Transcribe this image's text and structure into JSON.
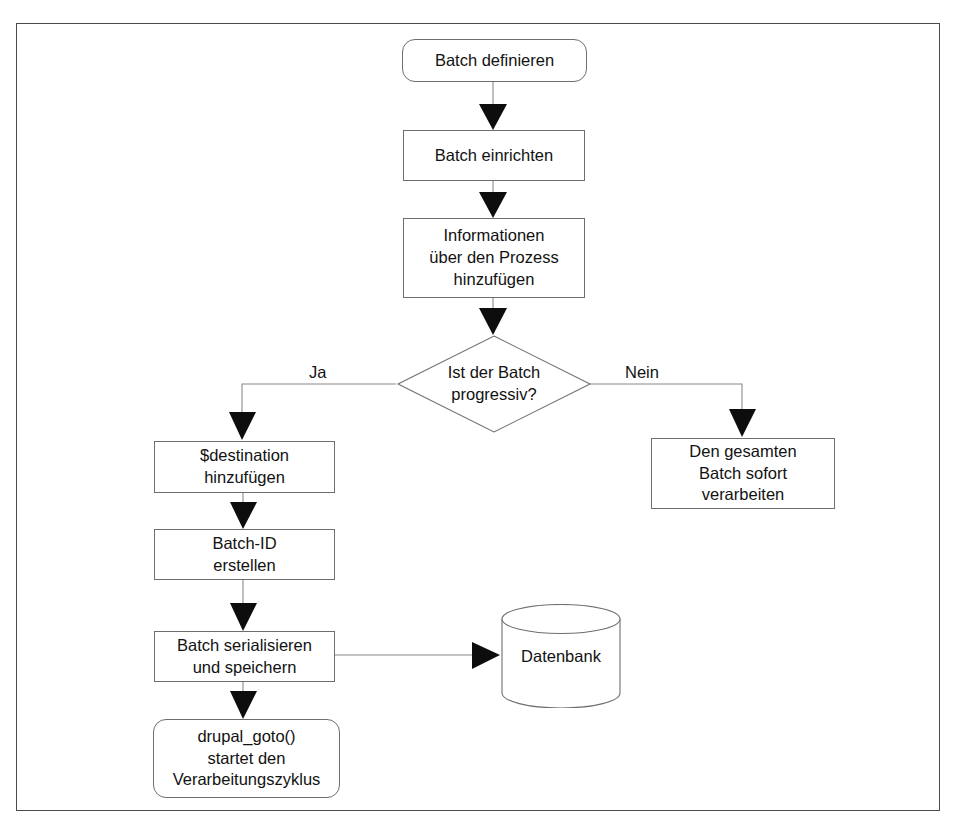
{
  "diagram": {
    "language": "de",
    "frame_border_color": "#4a4a4a",
    "node_border_color": "#6e6e6e",
    "connector_color": "#8a8a8a",
    "arrowhead_color": "#0d0d0d",
    "background_color": "#ffffff",
    "text_color": "#121212"
  },
  "nodes": [
    {
      "id": "batch-definieren",
      "label": "Batch definieren",
      "shape": "rounded-rectangle",
      "x": 401,
      "y": 38,
      "w": 185,
      "h": 43
    },
    {
      "id": "batch-einrichten",
      "label": "Batch einrichten",
      "shape": "rectangle",
      "x": 402,
      "y": 129,
      "w": 182,
      "h": 51
    },
    {
      "id": "informationen-hinzufuegen",
      "label": "Informationen\nüber den Prozess\nhinzufügen",
      "shape": "rectangle",
      "x": 402,
      "y": 217,
      "w": 182,
      "h": 80
    },
    {
      "id": "ist-der-batch-progressiv",
      "label": "Ist der Batch\nprogressiv?",
      "shape": "diamond",
      "x": 396,
      "y": 334,
      "w": 194,
      "h": 98
    },
    {
      "id": "destination-hinzufuegen",
      "label": "$destination\nhinzufügen",
      "shape": "rectangle",
      "x": 153,
      "y": 440,
      "w": 181,
      "h": 52
    },
    {
      "id": "batch-id-erstellen",
      "label": "Batch-ID\nerstellen",
      "shape": "rectangle",
      "x": 153,
      "y": 528,
      "w": 181,
      "h": 51
    },
    {
      "id": "batch-serialisieren",
      "label": "Batch serialisieren\nund speichern",
      "shape": "rectangle",
      "x": 153,
      "y": 630,
      "w": 181,
      "h": 51
    },
    {
      "id": "drupal-goto",
      "label": "drupal_goto()\nstartet den\nVerarbeitungszyklus",
      "shape": "rounded-rectangle",
      "x": 152,
      "y": 718,
      "w": 187,
      "h": 79
    },
    {
      "id": "gesamten-batch-verarbeiten",
      "label": "Den gesamten\nBatch sofort\nverarbeiten",
      "shape": "rectangle",
      "x": 650,
      "y": 437,
      "w": 184,
      "h": 71
    },
    {
      "id": "datenbank",
      "label": "Datenbank",
      "shape": "cylinder",
      "x": 500,
      "y": 603,
      "w": 120,
      "h": 104
    }
  ],
  "edges": [
    {
      "id": "e1",
      "from": "batch-definieren",
      "to": "batch-einrichten",
      "label": ""
    },
    {
      "id": "e2",
      "from": "batch-einrichten",
      "to": "informationen-hinzufuegen",
      "label": ""
    },
    {
      "id": "e3",
      "from": "informationen-hinzufuegen",
      "to": "ist-der-batch-progressiv",
      "label": ""
    },
    {
      "id": "e4",
      "from": "ist-der-batch-progressiv",
      "to": "destination-hinzufuegen",
      "label": "Ja"
    },
    {
      "id": "e5",
      "from": "ist-der-batch-progressiv",
      "to": "gesamten-batch-verarbeiten",
      "label": "Nein"
    },
    {
      "id": "e6",
      "from": "destination-hinzufuegen",
      "to": "batch-id-erstellen",
      "label": ""
    },
    {
      "id": "e7",
      "from": "batch-id-erstellen",
      "to": "batch-serialisieren",
      "label": ""
    },
    {
      "id": "e8",
      "from": "batch-serialisieren",
      "to": "datenbank",
      "label": ""
    },
    {
      "id": "e9",
      "from": "batch-serialisieren",
      "to": "drupal-goto",
      "label": ""
    }
  ],
  "edge_labels": {
    "yes": "Ja",
    "no": "Nein"
  }
}
